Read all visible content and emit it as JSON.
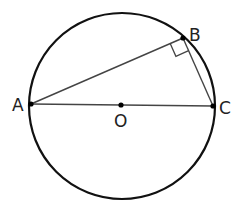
{
  "diagram": {
    "circle": {
      "cx": 122,
      "cy": 106,
      "r": 93,
      "stroke": "#111111"
    },
    "points": {
      "A": {
        "label": "A",
        "x": 31,
        "y": 104
      },
      "B": {
        "label": "B",
        "x": 183,
        "y": 38
      },
      "C": {
        "label": "C",
        "x": 213,
        "y": 106
      },
      "O": {
        "label": "O",
        "x": 121,
        "y": 105
      }
    },
    "segments": [
      "AB",
      "BC",
      "AC"
    ],
    "right_angle_at": "B",
    "colors": {
      "line": "#333333",
      "point": "#000000",
      "text": "#222222"
    }
  }
}
